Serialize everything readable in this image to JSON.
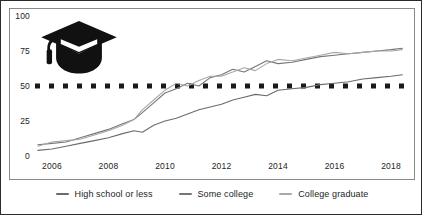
{
  "chart_data": {
    "type": "line",
    "title": "",
    "subtitle": "",
    "xlabel": "",
    "ylabel": "",
    "xlim": [
      2005.4,
      2018.6
    ],
    "ylim": [
      0,
      100
    ],
    "grid": false,
    "legend_position": "bottom",
    "x_ticks": [
      "2006",
      "2008",
      "2010",
      "2012",
      "2014",
      "2016",
      "2018"
    ],
    "x_tick_values": [
      2006,
      2008,
      2010,
      2012,
      2014,
      2016,
      2018
    ],
    "y_ticks": [
      "0",
      "25",
      "50",
      "75",
      "100"
    ],
    "y_tick_values": [
      0,
      25,
      50,
      75,
      100
    ],
    "reference_line": {
      "value": 50,
      "style": "dotted",
      "color": "#1a1a1a"
    },
    "icon": "graduation-cap-icon",
    "series": [
      {
        "name": "High school or less",
        "color": "#6b6b6b",
        "x": [
          2005.5,
          2006.0,
          2006.5,
          2007.0,
          2007.5,
          2008.0,
          2008.5,
          2008.9,
          2009.2,
          2009.6,
          2010.0,
          2010.4,
          2010.8,
          2011.2,
          2011.6,
          2012.0,
          2012.4,
          2012.8,
          2013.2,
          2013.6,
          2014.0,
          2014.5,
          2015.0,
          2015.5,
          2016.0,
          2016.5,
          2017.0,
          2017.5,
          2018.0,
          2018.4
        ],
        "values": [
          4,
          5,
          7,
          9,
          11,
          13,
          16,
          18,
          17,
          22,
          25,
          27,
          30,
          33,
          35,
          37,
          40,
          42,
          44,
          43,
          47,
          48,
          49,
          51,
          52,
          53,
          55,
          56,
          57,
          58
        ]
      },
      {
        "name": "Some college",
        "color": "#767676",
        "x": [
          2005.5,
          2006.0,
          2006.5,
          2007.0,
          2007.5,
          2008.0,
          2008.5,
          2008.9,
          2009.2,
          2009.6,
          2010.0,
          2010.4,
          2010.8,
          2011.2,
          2011.6,
          2012.0,
          2012.4,
          2012.8,
          2013.2,
          2013.6,
          2014.0,
          2014.5,
          2015.0,
          2015.5,
          2016.0,
          2016.5,
          2017.0,
          2017.5,
          2018.0,
          2018.4
        ],
        "values": [
          8,
          9,
          10,
          13,
          16,
          19,
          23,
          26,
          31,
          38,
          45,
          48,
          52,
          50,
          56,
          58,
          62,
          60,
          64,
          68,
          66,
          67,
          69,
          71,
          72,
          73,
          74,
          75,
          76,
          77
        ]
      },
      {
        "name": "College graduate",
        "color": "#a8a8a8",
        "x": [
          2005.5,
          2006.0,
          2006.5,
          2007.0,
          2007.5,
          2008.0,
          2008.5,
          2008.9,
          2009.2,
          2009.6,
          2010.0,
          2010.4,
          2010.8,
          2011.2,
          2011.6,
          2012.0,
          2012.4,
          2012.8,
          2013.2,
          2013.6,
          2014.0,
          2014.5,
          2015.0,
          2015.5,
          2016.0,
          2016.5,
          2017.0,
          2017.5,
          2018.0,
          2018.4
        ],
        "values": [
          7,
          10,
          11,
          12,
          15,
          18,
          22,
          26,
          33,
          40,
          47,
          52,
          50,
          54,
          57,
          57,
          60,
          63,
          61,
          66,
          69,
          68,
          70,
          72,
          74,
          73,
          74,
          75,
          75,
          76
        ]
      }
    ]
  },
  "legend": {
    "items": [
      {
        "label": "High school or less",
        "color": "#6b6b6b"
      },
      {
        "label": "Some college",
        "color": "#767676"
      },
      {
        "label": "College graduate",
        "color": "#a8a8a8"
      }
    ]
  }
}
